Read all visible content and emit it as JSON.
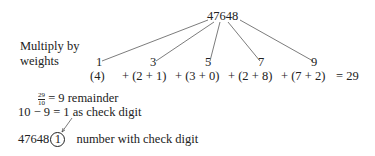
{
  "number": "47648",
  "label_line1": "Multiply by",
  "label_line2": "weights",
  "weights": [
    "1",
    "3",
    "5",
    "7",
    "9"
  ],
  "products_row": {
    "first": "(4)",
    "terms": [
      "+ (2 + 1)",
      "+ (3 + 0)",
      "+ (2 + 8)",
      "+ (7 + 2)"
    ],
    "result": "= 29"
  },
  "division": {
    "numerator": "29",
    "denominator": "10",
    "text": "= 9 remainder"
  },
  "subtraction": {
    "left": "10 − 9 = ",
    "digit": "1",
    "text": " as check digit"
  },
  "final": {
    "number": "47648",
    "check_digit": "1",
    "text": "number with check digit"
  }
}
